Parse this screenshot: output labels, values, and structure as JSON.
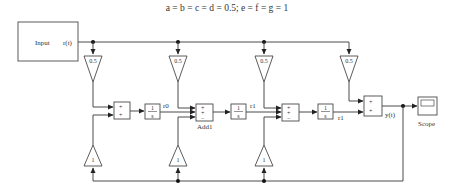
{
  "title": "a = b = c = d = 0.5; e = f = g = 1",
  "input_block": {
    "label": "Input",
    "port_label": "r(t)"
  },
  "top_gains": [
    {
      "id": "a",
      "value": "0.5"
    },
    {
      "id": "b",
      "value": "0.5"
    },
    {
      "id": "c",
      "value": "0.5"
    },
    {
      "id": "d",
      "value": "0.5"
    }
  ],
  "bottom_gains": [
    {
      "id": "e",
      "value": "1"
    },
    {
      "id": "f",
      "value": "1"
    },
    {
      "id": "g",
      "value": "1"
    }
  ],
  "sum_blocks": [
    {
      "id": "sum1",
      "signs": [
        "+",
        "+"
      ]
    },
    {
      "id": "add1",
      "signs": [
        "+",
        "+",
        "−"
      ],
      "label": "Add1"
    },
    {
      "id": "sum3",
      "signs": [
        "+",
        "+",
        "−"
      ]
    },
    {
      "id": "sum4",
      "signs": [
        "+",
        "+"
      ]
    }
  ],
  "integrators": [
    {
      "id": "int1",
      "numerator": "1",
      "denominator": "s",
      "output_label": "r0"
    },
    {
      "id": "int2",
      "numerator": "1",
      "denominator": "s",
      "output_label": "r1"
    },
    {
      "id": "int3",
      "numerator": "1",
      "denominator": "s",
      "output_label": "r1"
    }
  ],
  "output_label": "y(t)",
  "scope": {
    "label": "Scope"
  },
  "colors": {
    "line": "#4a4a4a",
    "text": "#333333",
    "background": "#ffffff"
  }
}
